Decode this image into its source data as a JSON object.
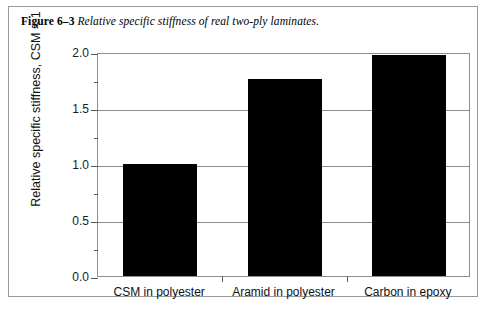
{
  "caption": {
    "figure_number": "Figure 6–3",
    "text": "Relative specific stiffness of real two-ply laminates."
  },
  "chart_data": {
    "type": "bar",
    "title": "",
    "categories": [
      "CSM in polyester",
      "Aramid in polyester",
      "Carbon in epoxy"
    ],
    "values": [
      1.0,
      1.76,
      1.97
    ],
    "xlabel": "",
    "ylabel": "Relative specific stiffness, CSM = 1",
    "ylim": [
      0.0,
      2.0
    ],
    "ytick_labels": [
      "0.0",
      "0.5",
      "1.0",
      "1.5",
      "2.0"
    ],
    "ytick_values": [
      0.0,
      0.5,
      1.0,
      1.5,
      2.0
    ],
    "yminor_tick_values": [
      0.25,
      0.75,
      1.25,
      1.75
    ],
    "grid": true,
    "legend": null,
    "bar_color": "#000000",
    "frame_color": "#8d8d8d"
  }
}
